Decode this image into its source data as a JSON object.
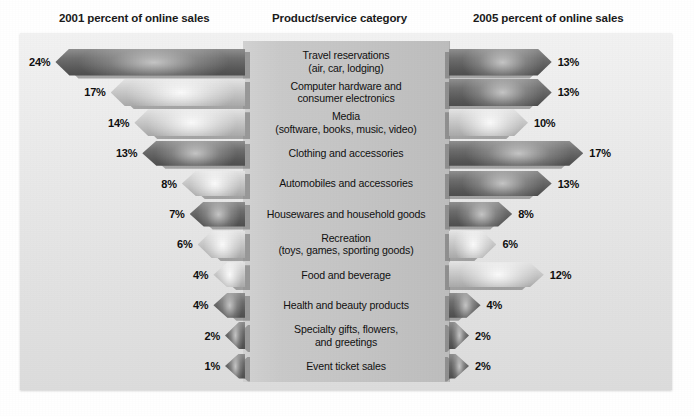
{
  "headers": {
    "left": "2001 percent of online sales",
    "center": "Product/service category",
    "right": "2005 percent of online sales"
  },
  "chart_data": {
    "type": "bar",
    "title": "",
    "xlabel": "",
    "ylabel": "",
    "orientation": "horizontal-diverging",
    "grid": false,
    "legend_position": "none",
    "categories": [
      "Travel reservations (air, car, lodging)",
      "Computer hardware and consumer electronics",
      "Media (software, books, music, video)",
      "Clothing and accessories",
      "Automobiles and accessories",
      "Housewares and household goods",
      "Recreation (toys, games, sporting goods)",
      "Food and beverage",
      "Health and beauty products",
      "Specialty gifts, flowers, and greetings",
      "Event ticket sales"
    ],
    "series": [
      {
        "name": "2001 percent of online sales",
        "values": [
          24,
          17,
          14,
          13,
          8,
          7,
          6,
          4,
          4,
          2,
          1
        ]
      },
      {
        "name": "2005 percent of online sales",
        "values": [
          13,
          13,
          10,
          17,
          13,
          8,
          6,
          12,
          4,
          2,
          2
        ]
      }
    ],
    "value_suffix": "%"
  },
  "rows": [
    {
      "label_lines": [
        "Travel reservations",
        "(air, car, lodging)"
      ],
      "left_value": "24%",
      "right_value": "13%",
      "left_pct": 24,
      "right_pct": 13,
      "left_shade": "dark",
      "right_shade": "dark"
    },
    {
      "label_lines": [
        "Computer hardware and",
        "consumer electronics"
      ],
      "left_value": "17%",
      "right_value": "13%",
      "left_pct": 17,
      "right_pct": 13,
      "left_shade": "light",
      "right_shade": "dark"
    },
    {
      "label_lines": [
        "Media",
        "(software, books, music, video)"
      ],
      "left_value": "14%",
      "right_value": "10%",
      "left_pct": 14,
      "right_pct": 10,
      "left_shade": "light",
      "right_shade": "light"
    },
    {
      "label_lines": [
        "Clothing and accessories"
      ],
      "left_value": "13%",
      "right_value": "17%",
      "left_pct": 13,
      "right_pct": 17,
      "left_shade": "dark",
      "right_shade": "dark"
    },
    {
      "label_lines": [
        "Automobiles and accessories"
      ],
      "left_value": "8%",
      "right_value": "13%",
      "left_pct": 8,
      "right_pct": 13,
      "left_shade": "light",
      "right_shade": "dark"
    },
    {
      "label_lines": [
        "Housewares and household goods"
      ],
      "left_value": "7%",
      "right_value": "8%",
      "left_pct": 7,
      "right_pct": 8,
      "left_shade": "dark",
      "right_shade": "dark"
    },
    {
      "label_lines": [
        "Recreation",
        "(toys, games, sporting goods)"
      ],
      "left_value": "6%",
      "right_value": "6%",
      "left_pct": 6,
      "right_pct": 6,
      "left_shade": "light",
      "right_shade": "light"
    },
    {
      "label_lines": [
        "Food and beverage"
      ],
      "left_value": "4%",
      "right_value": "12%",
      "left_pct": 4,
      "right_pct": 12,
      "left_shade": "light",
      "right_shade": "light"
    },
    {
      "label_lines": [
        "Health and beauty products"
      ],
      "left_value": "4%",
      "right_value": "4%",
      "left_pct": 4,
      "right_pct": 4,
      "left_shade": "dark",
      "right_shade": "dark"
    },
    {
      "label_lines": [
        "Specialty gifts, flowers,",
        "and greetings"
      ],
      "left_value": "2%",
      "right_value": "2%",
      "left_pct": 2,
      "right_pct": 2,
      "left_shade": "dark",
      "right_shade": "dark"
    },
    {
      "label_lines": [
        "Event ticket sales"
      ],
      "left_value": "1%",
      "right_value": "2%",
      "left_pct": 1,
      "right_pct": 2,
      "left_shade": "dark",
      "right_shade": "dark"
    }
  ],
  "colors": {
    "panel_bg": "#e8e8e8",
    "center_band": "#c6c6c6",
    "arrow_dark": "#5d5d5d",
    "arrow_light": "#c3c3c3",
    "text": "#111111"
  }
}
